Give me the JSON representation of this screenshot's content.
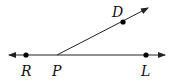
{
  "diagram": {
    "type": "geometry-rays",
    "stroke_color": "#222222",
    "point_color": "#000000",
    "line": {
      "name": "line RL",
      "from": [
        9,
        55
      ],
      "to": [
        165,
        55
      ],
      "arrows": [
        "left",
        "right"
      ]
    },
    "ray": {
      "name": "ray PD",
      "from": [
        57,
        55
      ],
      "to": [
        148,
        8
      ],
      "arrows": [
        "end"
      ]
    },
    "points": [
      {
        "label": "R",
        "x": 26,
        "y": 55,
        "label_x": 21,
        "label_y": 76
      },
      {
        "label": "P",
        "x": 57,
        "y": 55,
        "label_x": 52,
        "label_y": 76,
        "dot": false
      },
      {
        "label": "L",
        "x": 146,
        "y": 55,
        "label_x": 141,
        "label_y": 76
      },
      {
        "label": "D",
        "x": 123,
        "y": 22,
        "label_x": 112,
        "label_y": 17
      }
    ]
  }
}
